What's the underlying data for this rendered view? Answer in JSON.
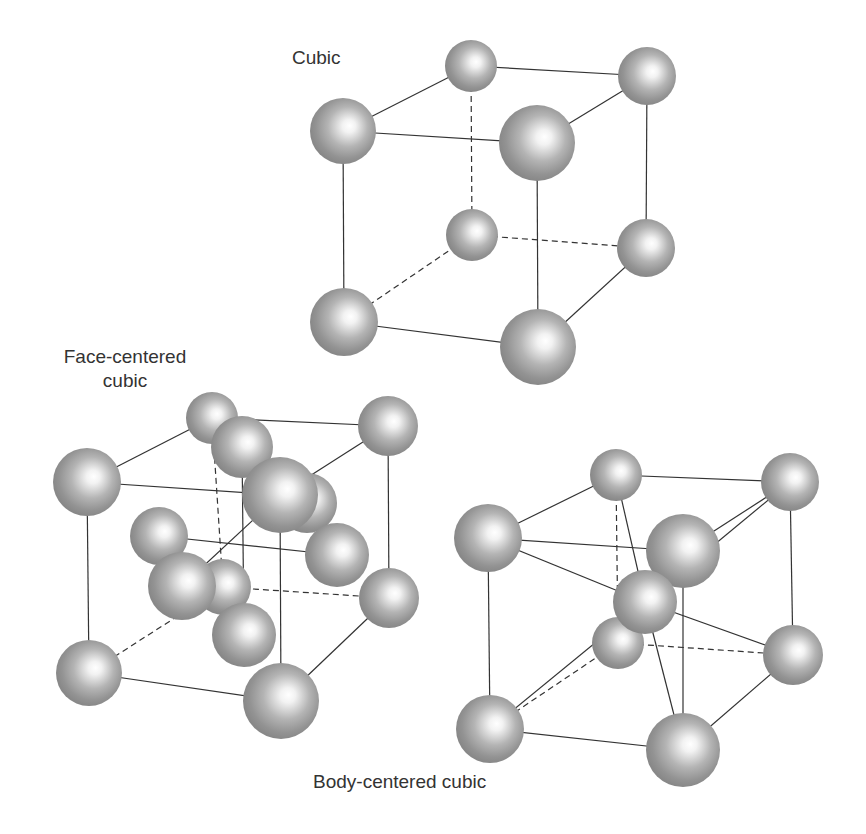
{
  "figure": {
    "background": "#ffffff",
    "sphere_edge_color": "#8a8a8a",
    "sphere_highlight_color": "#ffffff",
    "line_color": "#333333"
  },
  "labels": {
    "cubic": "Cubic",
    "fcc_line1": "Face-centered",
    "fcc_line2": "cubic",
    "bcc": "Body-centered cubic"
  },
  "structures": [
    {
      "name": "Cubic",
      "atoms": [
        {
          "id": "tbl",
          "x": 471,
          "y": 66,
          "r": 26
        },
        {
          "id": "tbr",
          "x": 647,
          "y": 76,
          "r": 29
        },
        {
          "id": "bbl",
          "x": 472,
          "y": 235,
          "r": 26
        },
        {
          "id": "bbr",
          "x": 646,
          "y": 248,
          "r": 29
        },
        {
          "id": "tfl",
          "x": 343,
          "y": 131,
          "r": 33
        },
        {
          "id": "bfl",
          "x": 344,
          "y": 322,
          "r": 34
        },
        {
          "id": "tfr",
          "x": 537,
          "y": 143,
          "r": 38
        },
        {
          "id": "bfr",
          "x": 538,
          "y": 347,
          "r": 38
        }
      ],
      "bonds": [
        {
          "a": "tbl",
          "b": "tbr",
          "dashed": false
        },
        {
          "a": "tfl",
          "b": "tbl",
          "dashed": false
        },
        {
          "a": "tfr",
          "b": "tbr",
          "dashed": false
        },
        {
          "a": "tfl",
          "b": "tfr",
          "dashed": false
        },
        {
          "a": "tbr",
          "b": "bbr",
          "dashed": false
        },
        {
          "a": "tfl",
          "b": "bfl",
          "dashed": false
        },
        {
          "a": "tfr",
          "b": "bfr",
          "dashed": false
        },
        {
          "a": "bfl",
          "b": "bfr",
          "dashed": false
        },
        {
          "a": "bfr",
          "b": "bbr",
          "dashed": false
        },
        {
          "a": "tbl",
          "b": "bbl",
          "dashed": true
        },
        {
          "a": "bbl",
          "b": "bbr",
          "dashed": true
        },
        {
          "a": "bfl",
          "b": "bbl",
          "dashed": true
        }
      ]
    },
    {
      "name": "Face-centered cubic",
      "atoms": [
        {
          "id": "tbr",
          "x": 388,
          "y": 426,
          "r": 30
        },
        {
          "id": "bbr",
          "x": 389,
          "y": 598,
          "r": 30
        },
        {
          "id": "tbl",
          "x": 212,
          "y": 418,
          "r": 26
        },
        {
          "id": "fbk",
          "x": 223,
          "y": 587,
          "r": 28
        },
        {
          "id": "frt",
          "x": 307,
          "y": 503,
          "r": 30
        },
        {
          "id": "ftp",
          "x": 242,
          "y": 447,
          "r": 31
        },
        {
          "id": "tfl",
          "x": 87,
          "y": 482,
          "r": 34
        },
        {
          "id": "flf",
          "x": 159,
          "y": 536,
          "r": 29
        },
        {
          "id": "bfl",
          "x": 89,
          "y": 673,
          "r": 33
        },
        {
          "id": "tfr",
          "x": 280,
          "y": 495,
          "r": 38
        },
        {
          "id": "frr",
          "x": 337,
          "y": 555,
          "r": 32
        },
        {
          "id": "ffr",
          "x": 182,
          "y": 586,
          "r": 34
        },
        {
          "id": "fbt",
          "x": 244,
          "y": 635,
          "r": 32
        },
        {
          "id": "bfr",
          "x": 281,
          "y": 701,
          "r": 38
        }
      ],
      "bonds": [
        {
          "a": "tbl",
          "b": "tbr",
          "dashed": false
        },
        {
          "a": "tfl",
          "b": "tbl",
          "dashed": false
        },
        {
          "a": "tfr",
          "b": "tbr",
          "dashed": false
        },
        {
          "a": "tfl",
          "b": "tfr",
          "dashed": false
        },
        {
          "a": "tbr",
          "b": "bbr",
          "dashed": false
        },
        {
          "a": "tfl",
          "b": "bfl",
          "dashed": false
        },
        {
          "a": "tfr",
          "b": "bfr",
          "dashed": false
        },
        {
          "a": "bfl",
          "b": "bfr",
          "dashed": false
        },
        {
          "a": "bfr",
          "b": "bbr",
          "dashed": false
        },
        {
          "a": "tbl",
          "b": "fbk",
          "dashed": true
        },
        {
          "a": "fbk",
          "b": "bbr",
          "dashed": true
        },
        {
          "a": "bfl",
          "b": "fbk",
          "dashed": true
        },
        {
          "a": "flf",
          "b": "frr",
          "dashed": false
        },
        {
          "a": "ftp",
          "b": "fbt",
          "dashed": false
        },
        {
          "a": "tfr",
          "b": "ffr",
          "dashed": false
        }
      ]
    },
    {
      "name": "Body-centered cubic",
      "atoms": [
        {
          "id": "tbl",
          "x": 616,
          "y": 475,
          "r": 26
        },
        {
          "id": "tbr",
          "x": 790,
          "y": 482,
          "r": 29
        },
        {
          "id": "bbl",
          "x": 618,
          "y": 643,
          "r": 26
        },
        {
          "id": "bbr",
          "x": 793,
          "y": 655,
          "r": 30
        },
        {
          "id": "tfl",
          "x": 488,
          "y": 538,
          "r": 34
        },
        {
          "id": "bfl",
          "x": 490,
          "y": 729,
          "r": 34
        },
        {
          "id": "tfr",
          "x": 683,
          "y": 551,
          "r": 37
        },
        {
          "id": "ctr",
          "x": 645,
          "y": 602,
          "r": 32
        },
        {
          "id": "bfr",
          "x": 683,
          "y": 750,
          "r": 37
        }
      ],
      "bonds": [
        {
          "a": "tbl",
          "b": "tbr",
          "dashed": false
        },
        {
          "a": "tfl",
          "b": "tbl",
          "dashed": false
        },
        {
          "a": "tfr",
          "b": "tbr",
          "dashed": false
        },
        {
          "a": "tfl",
          "b": "tfr",
          "dashed": false
        },
        {
          "a": "tbr",
          "b": "bbr",
          "dashed": false
        },
        {
          "a": "tfl",
          "b": "bfl",
          "dashed": false
        },
        {
          "a": "tfr",
          "b": "bfr",
          "dashed": false
        },
        {
          "a": "bfl",
          "b": "bfr",
          "dashed": false
        },
        {
          "a": "bfr",
          "b": "bbr",
          "dashed": false
        },
        {
          "a": "tbl",
          "b": "bbl",
          "dashed": true
        },
        {
          "a": "bbl",
          "b": "bbr",
          "dashed": true
        },
        {
          "a": "bfl",
          "b": "bbl",
          "dashed": true
        },
        {
          "a": "tfl",
          "b": "ctr",
          "dashed": false
        },
        {
          "a": "tbl",
          "b": "ctr",
          "dashed": false
        },
        {
          "a": "tbr",
          "b": "ctr",
          "dashed": false
        },
        {
          "a": "bbr",
          "b": "ctr",
          "dashed": false
        },
        {
          "a": "bfl",
          "b": "ctr",
          "dashed": false
        },
        {
          "a": "bfr",
          "b": "ctr",
          "dashed": false
        },
        {
          "a": "tfr",
          "b": "ctr",
          "dashed": false
        },
        {
          "a": "bbl",
          "b": "ctr",
          "dashed": false
        }
      ]
    }
  ]
}
